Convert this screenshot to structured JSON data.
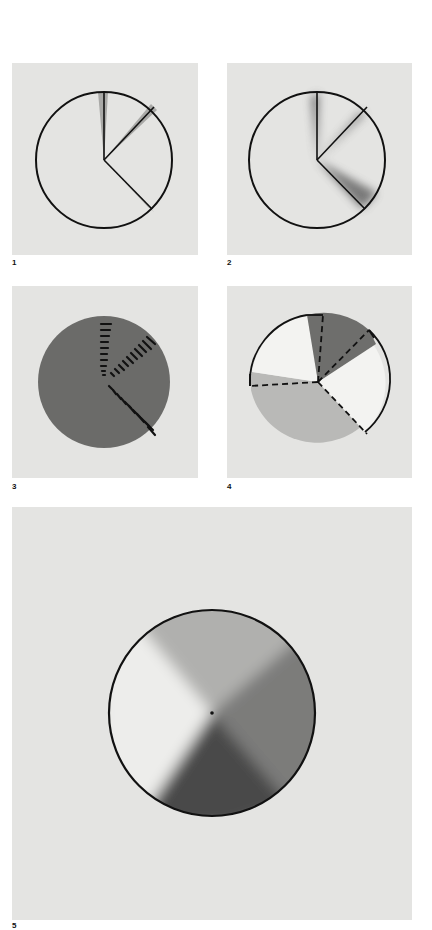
{
  "figures": [
    {
      "label": "1",
      "description": "Circle outline divided by three radial lines with light gray shadow wedges"
    },
    {
      "label": "2",
      "description": "Circle outline divided by three radial lines with soft blurred dark shading along lines"
    },
    {
      "label": "3",
      "description": "Solid dark gray disc with three radial rows of short black dashes"
    },
    {
      "label": "4",
      "description": "Partially outlined circle with dashed radial lines, dark gray wedge and light gray sector"
    },
    {
      "label": "5",
      "description": "Large outlined circle with conical gradient shading and a center dot"
    }
  ],
  "colors": {
    "panel_bg": "#e4e4e2",
    "page_bg": "#ffffff",
    "stroke": "#111111",
    "shadow_gray": "#a9a9a7",
    "disc_dark": "#6b6b69",
    "wedge_dark": "#6e6e6c",
    "sector_light": "#b9b9b7",
    "white_fill": "#f3f3f1"
  }
}
